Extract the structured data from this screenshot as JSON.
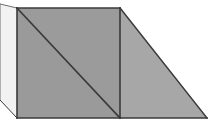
{
  "figure": {
    "canvas": {
      "width": 213,
      "height": 128,
      "background": "#ffffff"
    },
    "palette": {
      "left_face_fill": "#f2f2f2",
      "square_upper_fill": "#9b9b9b",
      "square_lower_fill": "#9a9a9a",
      "right_triangle_fill": "#a7a7a7",
      "outline": "#3a3a3a",
      "outline_soft": "#6e6e6e"
    },
    "shapes": [
      {
        "name": "left-light-face",
        "type": "polygon",
        "fill_key": "left_face_fill",
        "points": "0,4 17,8 17,118 0,100",
        "label": "Left light quadrilateral face"
      },
      {
        "name": "square-upper-right-triangle",
        "type": "polygon",
        "fill_key": "square_upper_fill",
        "points": "17,8 120,8 120,118",
        "label": "Upper-right triangle of center square"
      },
      {
        "name": "square-lower-left-triangle",
        "type": "polygon",
        "fill_key": "square_lower_fill",
        "points": "17,8 120,118 17,118",
        "label": "Lower-left triangle of center square"
      },
      {
        "name": "right-triangle-face",
        "type": "polygon",
        "fill_key": "right_triangle_fill",
        "points": "120,8 207,118 120,118",
        "label": "Right sloping triangular face"
      }
    ],
    "edges": [
      {
        "name": "top-left-slope-edge",
        "points": "0,4 17,8",
        "stroke_key": "outline_soft",
        "width": 1
      },
      {
        "name": "left-vertical-edge",
        "points": "0,4 0,100",
        "stroke_key": "outline_soft",
        "width": 1
      },
      {
        "name": "bottom-left-slope-edge",
        "points": "0,100 17,118",
        "stroke_key": "outline",
        "width": 1
      },
      {
        "name": "square-top-edge",
        "points": "17,8 120,8",
        "stroke_key": "outline",
        "width": 1.6
      },
      {
        "name": "square-left-edge",
        "points": "17,8 17,118",
        "stroke_key": "outline",
        "width": 1.6
      },
      {
        "name": "square-bottom-edge",
        "points": "17,118 120,118",
        "stroke_key": "outline",
        "width": 1.6
      },
      {
        "name": "square-diagonal-edge",
        "points": "17,8 120,118",
        "stroke_key": "outline",
        "width": 1.6
      },
      {
        "name": "center-vertical-edge",
        "points": "120,8 120,118",
        "stroke_key": "outline",
        "width": 1.6
      },
      {
        "name": "right-hypotenuse-edge",
        "points": "120,8 207,118",
        "stroke_key": "outline",
        "width": 1.6
      },
      {
        "name": "right-bottom-edge",
        "points": "120,118 207,118",
        "stroke_key": "outline",
        "width": 1.6
      }
    ]
  }
}
